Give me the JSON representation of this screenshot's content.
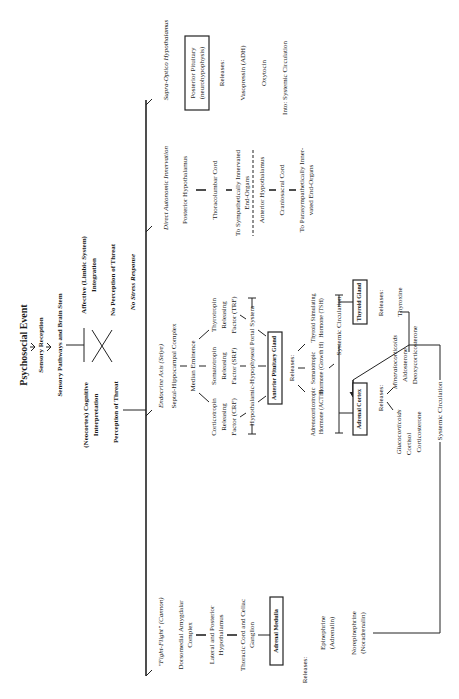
{
  "origin": {
    "event": "Psychosocial Event",
    "reception": "Sensory Reception",
    "pathways": "Sensory Pathways and Brain Stem",
    "cognitive_1": "(Neocortex) Cognitive",
    "cognitive_2": "Interpretation",
    "affective_1": "Affective (Limbic System)",
    "affective_2": "Integration",
    "perception": "Perception of Threat",
    "no_perception": "No Perception of Threat",
    "no_stress": "No Stress Response"
  },
  "fight_flight": {
    "title": "\"Fight-Flight\" (Cannon)",
    "steps": [
      [
        "Dorsomedial Amygdalar",
        "Complex"
      ],
      [
        "Lateral and Posterior",
        "Hypothalamus"
      ],
      [
        "Thoracic Cord and Celiac",
        "Ganglion"
      ]
    ],
    "gland": "Adrenal Medulla",
    "releases": "Releases:",
    "hormones": [
      [
        "Epinephrine",
        "(Adrenalin)"
      ],
      [
        "Norepinephrine",
        "(Noradrenalin)"
      ]
    ]
  },
  "endocrine": {
    "title": "Endocrine Axis (Selye)",
    "septal": "Septal-Hippocampal Complex",
    "median": "Median Eminence",
    "factors": [
      [
        "Corticotropin",
        "Releasing",
        "Factor (CRF)"
      ],
      [
        "Somatotropin",
        "Releasing",
        "Factor (SRF)"
      ],
      [
        "Thyrotropin",
        "Releasing",
        "Factor (TRF)"
      ]
    ],
    "portal": "Hypothalamic-Hypophyseal Portal System",
    "anterior": "Anterior Pituitary Gland",
    "releases": "Releases:",
    "pituitary_hormones": [
      [
        "Adrenocorticotropic",
        "Hormone (ACTH)"
      ],
      [
        "Somatotropic",
        "Hormone (Growth H)"
      ],
      [
        "Thyroid Stimulating",
        "Hormone (TSH)"
      ]
    ],
    "systemic_1": "Systemic Circulation",
    "adrenal_cortex": "Adrenal Cortex",
    "thyroid": "Thyroid Gland",
    "cortex_releases": "Releases:",
    "gluco": [
      "Glucocorticoids",
      "Cortisol",
      "Corticosterone"
    ],
    "mineralo": [
      "Mineralocorticoids",
      "Aldosterone",
      "Deoxycorticosterone"
    ],
    "thyroid_releases": "Releases:",
    "thyroxine": "Thyroxine",
    "systemic_2": "Systemic Circulation"
  },
  "autonomic": {
    "title": "Direct Autonomic Innervation",
    "sympathetic": [
      "Posterior Hypothalamus",
      "Thoracolumbar Cord",
      "To Sympathetically Innervated",
      "End-Organs"
    ],
    "parasympathetic": [
      "Anterior Hypothalamus",
      "Craniosacral Cord",
      "To Parasympathetically Inner-",
      "vated End-Organs"
    ]
  },
  "supraoptic": {
    "title": "Supra-Optico Hypothalamus",
    "gland_1": "Posterior Pituitary",
    "gland_2": "(neurohypophysis)",
    "releases": "Releases:",
    "hormones": [
      "Vasopressin (ADH)",
      "Oxytocin"
    ],
    "into": "Into: Systemic Circulation"
  }
}
